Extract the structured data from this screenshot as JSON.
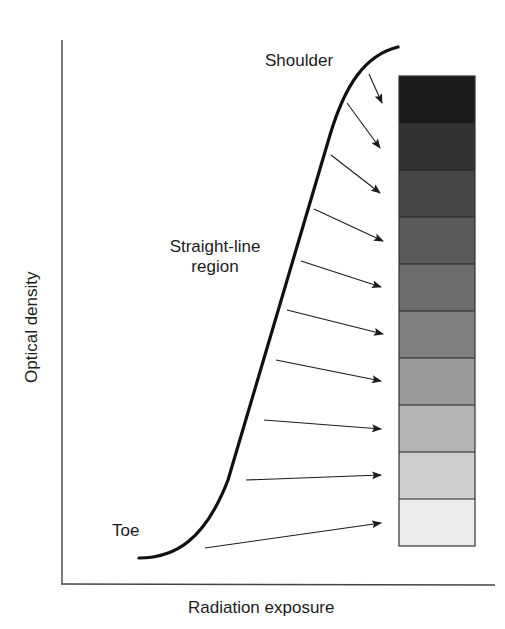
{
  "figure": {
    "type": "characteristic-curve-diagram",
    "x_axis_label": "Radiation exposure",
    "y_axis_label": "Optical density",
    "annotations": {
      "shoulder": "Shoulder",
      "straight_line": [
        "Straight-line",
        "region"
      ],
      "toe": "Toe"
    },
    "step_wedge": {
      "steps": 10,
      "gray_levels": [
        "#1a1a1a",
        "#333333",
        "#474747",
        "#5a5a5a",
        "#6c6c6c",
        "#808080",
        "#9a9a9a",
        "#b4b4b4",
        "#cecece",
        "#ececec"
      ]
    },
    "arrows": [
      {
        "from": [
          369,
          74
        ],
        "to": [
          382,
          103
        ]
      },
      {
        "from": [
          347,
          103
        ],
        "to": [
          380,
          148
        ]
      },
      {
        "from": [
          331,
          155
        ],
        "to": [
          380,
          193
        ]
      },
      {
        "from": [
          314,
          209
        ],
        "to": [
          383,
          241
        ]
      },
      {
        "from": [
          301,
          261
        ],
        "to": [
          381,
          287
        ]
      },
      {
        "from": [
          287,
          310
        ],
        "to": [
          383,
          334
        ]
      },
      {
        "from": [
          276,
          360
        ],
        "to": [
          381,
          381
        ]
      },
      {
        "from": [
          264,
          420
        ],
        "to": [
          381,
          429
        ]
      },
      {
        "from": [
          246,
          480
        ],
        "to": [
          381,
          475
        ]
      },
      {
        "from": [
          205,
          548
        ],
        "to": [
          381,
          523
        ]
      }
    ],
    "colors": {
      "ink": "#1c1c1c",
      "axis": "#444444"
    }
  }
}
